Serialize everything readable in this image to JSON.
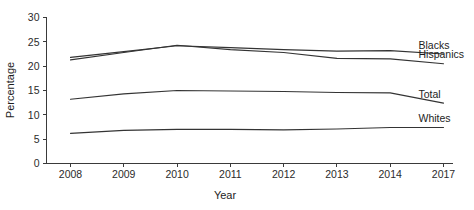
{
  "chart_data": {
    "type": "line",
    "title": "",
    "xlabel": "Year",
    "ylabel": "Percentage",
    "categories": [
      "2008",
      "2009",
      "2010",
      "2011",
      "2012",
      "2013",
      "2014",
      "2017"
    ],
    "x": [
      2008,
      2009,
      2010,
      2011,
      2012,
      2013,
      2014,
      2017
    ],
    "ylim": [
      0,
      30
    ],
    "yticks": [
      0,
      5,
      10,
      15,
      20,
      25,
      30
    ],
    "ytick_labels": [
      "0",
      "5",
      "10",
      "15",
      "20",
      "25",
      "30"
    ],
    "grid": false,
    "legend_position": "right-inline-labels",
    "series": [
      {
        "name": "Blacks",
        "values": [
          21.8,
          23.0,
          24.2,
          23.8,
          23.4,
          23.1,
          23.2,
          22.5
        ]
      },
      {
        "name": "Hispanics",
        "values": [
          21.3,
          22.8,
          24.3,
          23.4,
          22.8,
          21.6,
          21.5,
          20.5
        ]
      },
      {
        "name": "Total",
        "values": [
          13.2,
          14.3,
          15.0,
          14.9,
          14.8,
          14.6,
          14.5,
          12.4
        ]
      },
      {
        "name": "Whites",
        "values": [
          6.2,
          6.8,
          7.0,
          7.0,
          6.9,
          7.1,
          7.4,
          7.4
        ]
      }
    ]
  },
  "axes": {
    "y_axis_title": "Percentage",
    "x_axis_title": "Year"
  },
  "series_labels": {
    "blacks": "Blacks",
    "hispanics": "Hispanics",
    "total": "Total",
    "whites": "Whites"
  },
  "colors": {
    "line": "#343434",
    "axis": "#3a3a3a",
    "text": "#1d1d1d",
    "background": "#ffffff"
  }
}
